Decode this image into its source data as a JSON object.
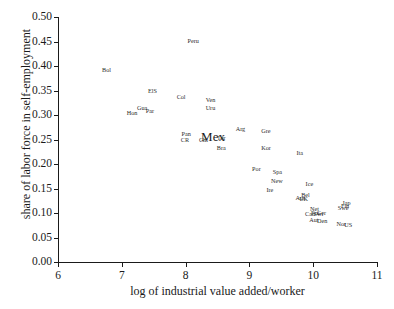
{
  "chart_data": {
    "type": "scatter",
    "title": "",
    "xlabel": "log of industrial value added/worker",
    "ylabel": "share of labor force in self-employment",
    "xlim": [
      6,
      11
    ],
    "ylim": [
      0.0,
      0.5
    ],
    "xticks": [
      "6",
      "7",
      "8",
      "9",
      "10",
      "11"
    ],
    "yticks": [
      "0.00",
      "0.05",
      "0.10",
      "0.15",
      "0.20",
      "0.25",
      "0.30",
      "0.35",
      "0.40",
      "0.45",
      "0.50"
    ],
    "grid": false,
    "legend": "none",
    "marker_style": "text-label-only",
    "points": [
      {
        "label": "Peru",
        "x": 8.12,
        "y": 0.452
      },
      {
        "label": "Bol",
        "x": 6.76,
        "y": 0.392
      },
      {
        "label": "ElS",
        "x": 7.48,
        "y": 0.348
      },
      {
        "label": "Col",
        "x": 7.93,
        "y": 0.337
      },
      {
        "label": "Ven",
        "x": 8.39,
        "y": 0.33
      },
      {
        "label": "Uru",
        "x": 8.39,
        "y": 0.315
      },
      {
        "label": "Gua",
        "x": 7.32,
        "y": 0.315
      },
      {
        "label": "Par",
        "x": 7.44,
        "y": 0.308
      },
      {
        "label": "Hon",
        "x": 7.16,
        "y": 0.305
      },
      {
        "label": "Pan",
        "x": 8.01,
        "y": 0.262
      },
      {
        "label": "CR",
        "x": 7.99,
        "y": 0.248
      },
      {
        "label": "Arg",
        "x": 8.86,
        "y": 0.272
      },
      {
        "label": "Gre",
        "x": 9.26,
        "y": 0.268
      },
      {
        "label": "Mex",
        "x": 8.43,
        "y": 0.258
      },
      {
        "label": "Tur",
        "x": 8.56,
        "y": 0.253
      },
      {
        "label": "Chi",
        "x": 8.28,
        "y": 0.248
      },
      {
        "label": "Bra",
        "x": 8.56,
        "y": 0.233
      },
      {
        "label": "Kor",
        "x": 9.26,
        "y": 0.233
      },
      {
        "label": "Ita",
        "x": 9.79,
        "y": 0.222
      },
      {
        "label": "Por",
        "x": 9.11,
        "y": 0.19
      },
      {
        "label": "Spa",
        "x": 9.44,
        "y": 0.183
      },
      {
        "label": "New",
        "x": 9.43,
        "y": 0.165
      },
      {
        "label": "Ice",
        "x": 9.94,
        "y": 0.16
      },
      {
        "label": "Ire",
        "x": 9.32,
        "y": 0.147
      },
      {
        "label": "Aus",
        "x": 9.8,
        "y": 0.131
      },
      {
        "label": "Bel",
        "x": 9.88,
        "y": 0.136
      },
      {
        "label": "UK",
        "x": 9.85,
        "y": 0.128
      },
      {
        "label": "Jap",
        "x": 10.52,
        "y": 0.121
      },
      {
        "label": "Fin",
        "x": 10.5,
        "y": 0.115
      },
      {
        "label": "Swe",
        "x": 10.47,
        "y": 0.11
      },
      {
        "label": "Net",
        "x": 10.02,
        "y": 0.108
      },
      {
        "label": "Fra",
        "x": 10.03,
        "y": 0.101
      },
      {
        "label": "Can",
        "x": 9.95,
        "y": 0.098
      },
      {
        "label": "Ger",
        "x": 10.13,
        "y": 0.1
      },
      {
        "label": "Swi",
        "x": 10.08,
        "y": 0.097
      },
      {
        "label": "Aut",
        "x": 10.01,
        "y": 0.085
      },
      {
        "label": "Den",
        "x": 10.14,
        "y": 0.083
      },
      {
        "label": "Nor",
        "x": 10.44,
        "y": 0.078
      },
      {
        "label": "US",
        "x": 10.55,
        "y": 0.076
      }
    ]
  }
}
